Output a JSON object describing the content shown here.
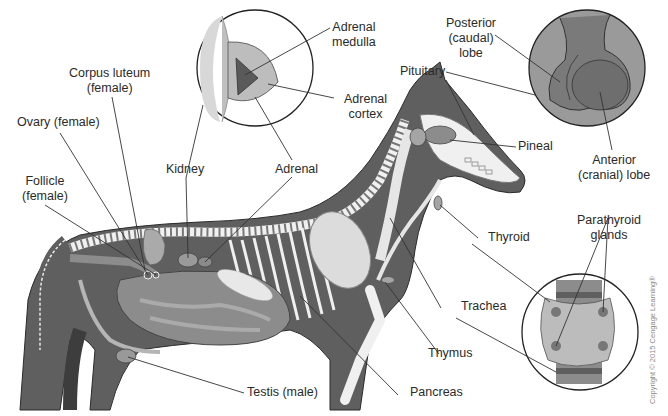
{
  "diagram": {
    "colors": {
      "body": "#5f5f5f",
      "organ": "#8c8c8c",
      "bone": "#f0f0f0",
      "inset_bg": "#9a9a9a",
      "line": "#333333",
      "text": "#2a2a2a"
    },
    "labels": {
      "corpus_luteum": [
        "Corpus luteum",
        "(female)"
      ],
      "ovary": "Ovary (female)",
      "follicle": [
        "Follicle",
        "(female)"
      ],
      "kidney": "Kidney",
      "adrenal": "Adrenal",
      "adrenal_medulla": [
        "Adrenal",
        "medulla"
      ],
      "adrenal_cortex": [
        "Adrenal",
        "cortex"
      ],
      "posterior_lobe": [
        "Posterior",
        "(caudal)",
        "lobe"
      ],
      "pituitary": "Pituitary",
      "pineal": "Pineal",
      "anterior_lobe": [
        "Anterior",
        "(cranial) lobe"
      ],
      "thyroid": "Thyroid",
      "parathyroid": [
        "Parathyroid",
        "glands"
      ],
      "trachea": "Trachea",
      "thymus": "Thymus",
      "pancreas": "Pancreas",
      "testis": "Testis (male)"
    },
    "insets": [
      {
        "name": "adrenal-inset",
        "cx": 255,
        "cy": 68,
        "r": 58
      },
      {
        "name": "pituitary-inset",
        "cx": 587,
        "cy": 68,
        "r": 58
      },
      {
        "name": "thyroid-inset",
        "cx": 580,
        "cy": 332,
        "r": 58
      }
    ],
    "copyright": "Copyright © 2015 Cengage Learning®"
  }
}
